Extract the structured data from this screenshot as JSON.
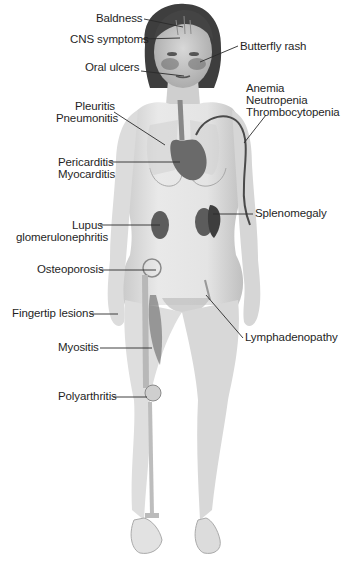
{
  "figure": {
    "colors": {
      "background": "#ffffff",
      "skin": "#e6e6e6",
      "skin_shadow": "#c8c8c8",
      "hair": "#3a3a3a",
      "organ": "#5a5a5a",
      "leader_line": "#2a2a2a",
      "label_text": "#1f1f1f"
    }
  },
  "labels": {
    "baldness": "Baldness",
    "cns_symptoms": "CNS symptoms",
    "butterfly_rash": "Butterfly rash",
    "oral_ulcers": "Oral ulcers",
    "anemia": "Anemia",
    "neutropenia": "Neutropenia",
    "thrombocytopenia": "Thrombocytopenia",
    "pleuritis": "Pleuritis",
    "pneumonitis": "Pneumonitis",
    "pericarditis": "Pericarditis",
    "myocarditis": "Myocarditis",
    "splenomegaly": "Splenomegaly",
    "lupus": "Lupus",
    "glomerulonephritis": "glomerulonephritis",
    "osteoporosis": "Osteoporosis",
    "fingertip_lesions": "Fingertip lesions",
    "lymphadenopathy": "Lymphadenopathy",
    "myositis": "Myositis",
    "polyarthritis": "Polyarthritis"
  }
}
